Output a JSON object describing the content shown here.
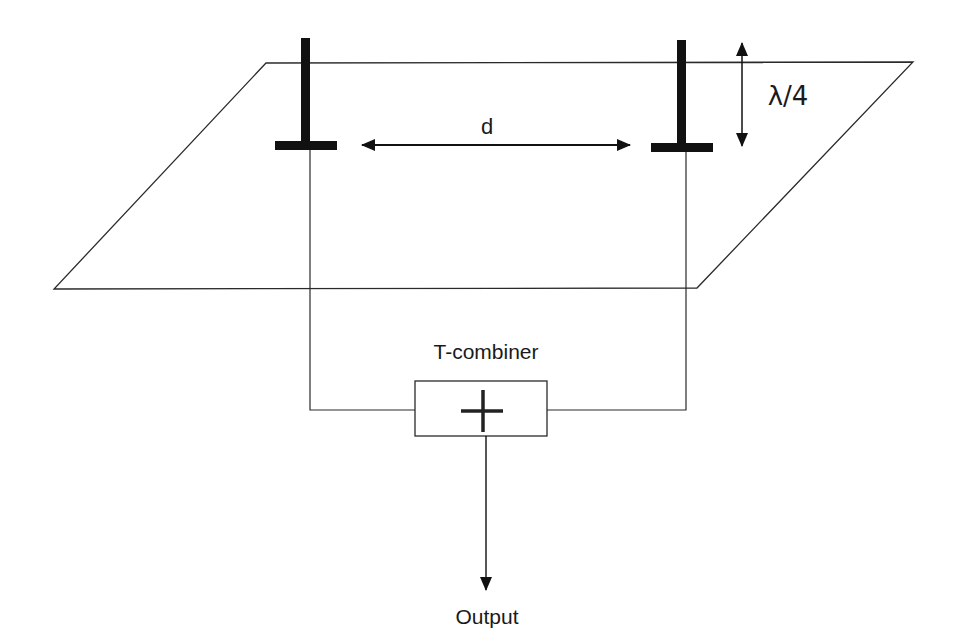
{
  "diagram": {
    "type": "two-element antenna array over ground plane",
    "labels": {
      "spacing": "d",
      "height": "λ/4",
      "combiner": "T-combiner",
      "output": "Output",
      "combiner_symbol": "+"
    },
    "colors": {
      "line": "#2a2a2a",
      "antenna": "#111111",
      "background": "#ffffff",
      "text": "#1a1a1a"
    },
    "elements": [
      {
        "id": "antenna-left",
        "kind": "monopole"
      },
      {
        "id": "antenna-right",
        "kind": "monopole"
      },
      {
        "id": "ground-plane",
        "kind": "parallelogram"
      },
      {
        "id": "t-combiner",
        "kind": "summing box"
      }
    ]
  }
}
